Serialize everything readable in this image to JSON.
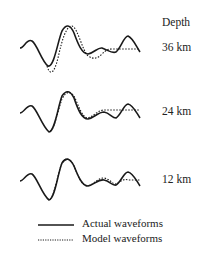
{
  "header": {
    "depth_label": "Depth"
  },
  "traces": [
    {
      "depth": "36 km",
      "baseline": 49
    },
    {
      "depth": "24 km",
      "baseline": 113
    },
    {
      "depth": "12 km",
      "baseline": 181
    }
  ],
  "legend": {
    "actual": "Actual waveforms",
    "model": "Model waveforms"
  },
  "colors": {
    "line": "#1a1a1a"
  }
}
